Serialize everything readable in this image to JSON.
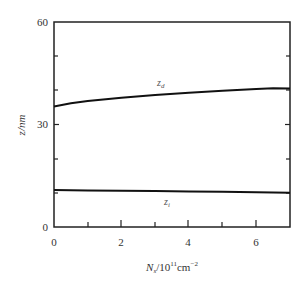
{
  "chart_data": {
    "type": "line",
    "title": "",
    "xlabel": "N_s/10^11 cm^-2",
    "ylabel": "z/nm",
    "xlim": [
      0,
      7
    ],
    "ylim": [
      0,
      60
    ],
    "x_ticks": [
      0,
      2,
      4,
      6
    ],
    "x_minor_ticks": [
      1,
      3,
      5
    ],
    "y_ticks": [
      0,
      30,
      60
    ],
    "y_minor_ticks": [
      10,
      20,
      40,
      50
    ],
    "grid": false,
    "legend": "inline labels",
    "series": [
      {
        "name": "z_d",
        "x": [
          0,
          0.5,
          1,
          2,
          3,
          4,
          5,
          6,
          6.5,
          7
        ],
        "values": [
          35.3,
          36.2,
          36.9,
          37.8,
          38.6,
          39.3,
          39.9,
          40.4,
          40.6,
          40.5
        ]
      },
      {
        "name": "z_i",
        "x": [
          0,
          1,
          2,
          3,
          4,
          5,
          6,
          7
        ],
        "values": [
          10.8,
          10.7,
          10.6,
          10.5,
          10.4,
          10.3,
          10.2,
          10.0
        ]
      }
    ]
  },
  "labels": {
    "x_axis_main": "N",
    "x_axis_sub": "s",
    "x_axis_rest": "/10",
    "x_axis_exp1": "11",
    "x_axis_unit": "cm",
    "x_axis_exp2": "−2",
    "y_axis": "z/nm",
    "series_zd_main": "z",
    "series_zd_sub": "d",
    "series_zi_main": "z",
    "series_zi_sub": "i",
    "y_tick_0": "0",
    "y_tick_30": "30",
    "y_tick_60": "60",
    "x_tick_0": "0",
    "x_tick_2": "2",
    "x_tick_4": "4",
    "x_tick_6": "6"
  }
}
